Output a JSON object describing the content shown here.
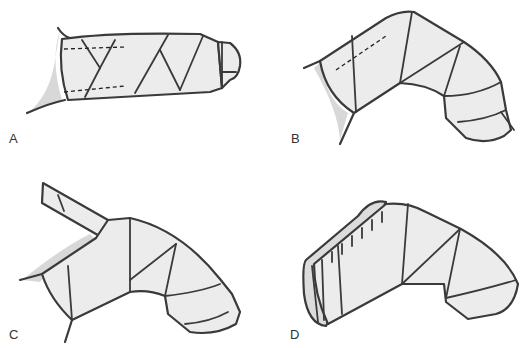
{
  "figure": {
    "panels": [
      {
        "id": "A",
        "label": "A",
        "description": "Straight finger wrapped in spiral bandage with dashed guide lines"
      },
      {
        "id": "B",
        "label": "B",
        "description": "Flexed finger wrapped with bandage, dashed line on proximal segment"
      },
      {
        "id": "C",
        "label": "C",
        "description": "Flexed finger with bandage tail extending from proximal end"
      },
      {
        "id": "D",
        "label": "D",
        "description": "Flexed finger bandage with cut/hatched proximal edge"
      }
    ]
  },
  "colors": {
    "outline": "#3a3a3a",
    "fill": "#ececec",
    "shade": "#d8d8d8",
    "background": "#ffffff"
  }
}
